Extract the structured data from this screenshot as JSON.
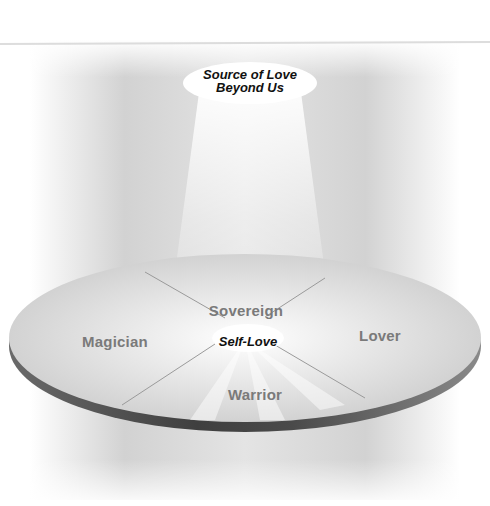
{
  "diagram": {
    "source_label_line1": "Source of Love",
    "source_label_line2": "Beyond Us",
    "center_label": "Self-Love",
    "segments": [
      {
        "name": "Sovereign",
        "position": "top"
      },
      {
        "name": "Magician",
        "position": "left"
      },
      {
        "name": "Lover",
        "position": "right"
      },
      {
        "name": "Warrior",
        "position": "bottom"
      }
    ],
    "colors": {
      "disc_top": "#dcdcdc",
      "disc_edge": "#555555",
      "label_gray": "#7a7a7a",
      "text_dark": "#111111"
    }
  }
}
